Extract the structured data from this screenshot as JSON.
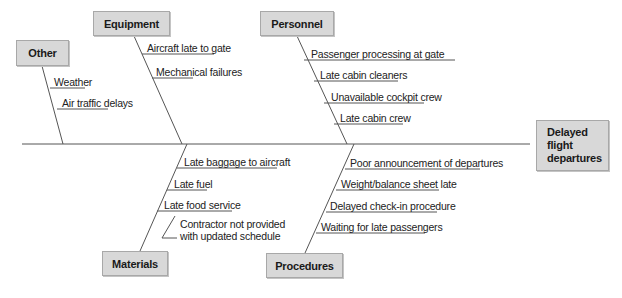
{
  "diagram": {
    "type": "fishbone",
    "effect": {
      "label": "Delayed\nflight\ndepartures"
    },
    "categories": {
      "other": {
        "label": "Other",
        "causes": [
          "Weather",
          "Air traffic delays"
        ]
      },
      "equipment": {
        "label": "Equipment",
        "causes": [
          "Aircraft late to gate",
          "Mechanical failures"
        ]
      },
      "personnel": {
        "label": "Personnel",
        "causes": [
          "Passenger processing at gate",
          "Late cabin cleaners",
          "Unavailable cockpit crew",
          "Late cabin crew"
        ]
      },
      "materials": {
        "label": "Materials",
        "causes": [
          "Late baggage to aircraft",
          "Late fuel",
          "Late food service"
        ],
        "sub_causes": [
          "Contractor not provided\nwith updated schedule"
        ]
      },
      "procedures": {
        "label": "Procedures",
        "causes": [
          "Poor announcement of departures",
          "Weight/balance sheet late",
          "Delayed check-in procedure",
          "Waiting for late passengers"
        ]
      }
    },
    "colors": {
      "box_fill": "#d8d8d8",
      "box_border": "#a8a8a8",
      "line": "#555555",
      "text": "#1a1a1a"
    }
  }
}
